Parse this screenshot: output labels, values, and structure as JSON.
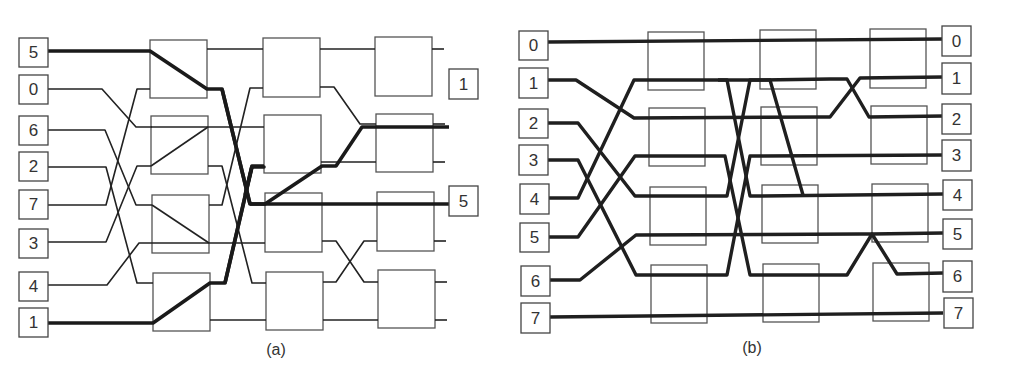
{
  "figure_a": {
    "caption": "(a)",
    "inputs": [
      "5",
      "0",
      "6",
      "2",
      "7",
      "3",
      "4",
      "1"
    ],
    "outputs": [
      {
        "label": "1",
        "port": 1
      },
      {
        "label": "5",
        "port": 4
      }
    ],
    "stages": 3,
    "switches_per_stage": 4,
    "highlighted_paths": [
      "5 -> 1",
      "1 -> 5"
    ]
  },
  "figure_b": {
    "caption": "(b)",
    "inputs": [
      "0",
      "1",
      "2",
      "3",
      "4",
      "5",
      "6",
      "7"
    ],
    "outputs": [
      "0",
      "1",
      "2",
      "3",
      "4",
      "5",
      "6",
      "7"
    ],
    "stages": 3,
    "switches_per_stage": 4
  }
}
